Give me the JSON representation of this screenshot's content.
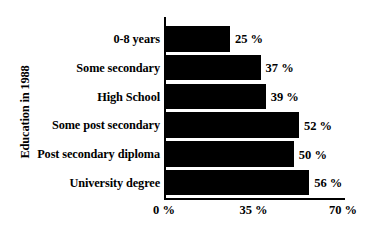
{
  "chart_data": {
    "type": "bar",
    "orientation": "horizontal",
    "title": "",
    "ylabel": "Education in 1988",
    "xlabel": "",
    "categories": [
      "0-8 years",
      "Some secondary",
      "High School",
      "Some post secondary",
      "Post secondary diploma",
      "University degree"
    ],
    "values": [
      25,
      37,
      39,
      52,
      50,
      56
    ],
    "value_labels": [
      "25 %",
      "37 %",
      "39 %",
      "52 %",
      "50 %",
      "56 %"
    ],
    "xlim": [
      0,
      70
    ],
    "xticks": [
      0,
      35,
      70
    ],
    "xtick_labels": [
      "0 %",
      "35 %",
      "70 %"
    ],
    "grid": false,
    "legend": false,
    "bar_color": "#000000",
    "background_color": "#ffffff"
  }
}
